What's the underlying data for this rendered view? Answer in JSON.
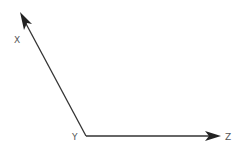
{
  "diagram": {
    "stroke_color": "#333333",
    "label_color": "#555555",
    "vertex": {
      "label": "Y",
      "x": 86,
      "y": 136
    },
    "arms": [
      {
        "name": "x-axis",
        "label": "X",
        "tip": {
          "x": 20,
          "y": 12
        }
      },
      {
        "name": "z-axis",
        "label": "Z",
        "tip": {
          "x": 221,
          "y": 136
        }
      }
    ]
  }
}
